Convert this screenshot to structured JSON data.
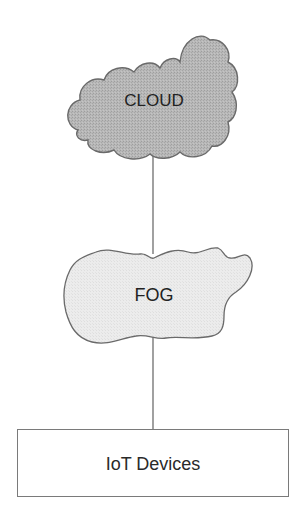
{
  "diagram": {
    "title": "",
    "layers": [
      {
        "id": "cloud",
        "label": "CLOUD",
        "shape": "cloud",
        "fill": "#b3b3b3"
      },
      {
        "id": "fog",
        "label": "FOG",
        "shape": "fog-blob",
        "fill": "#e9e9e9"
      },
      {
        "id": "iot",
        "label": "IoT Devices",
        "shape": "rectangle",
        "fill": "#ffffff"
      }
    ],
    "connections": [
      {
        "from": "CLOUD",
        "to": "FOG"
      },
      {
        "from": "FOG",
        "to": "IoT Devices"
      }
    ],
    "colors": {
      "stroke": "#6e6e6e",
      "text": "#222222"
    }
  }
}
